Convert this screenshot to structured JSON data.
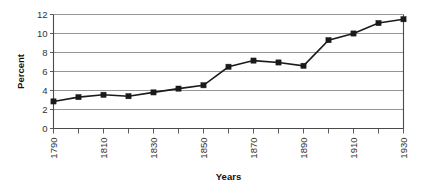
{
  "chart_data": {
    "type": "line",
    "title": "",
    "xlabel": "Years",
    "ylabel": "Percent",
    "x": [
      1790,
      1800,
      1810,
      1820,
      1830,
      1840,
      1850,
      1860,
      1870,
      1880,
      1890,
      1900,
      1910,
      1920,
      1930
    ],
    "values": [
      2.85,
      3.3,
      3.55,
      3.4,
      3.8,
      4.2,
      4.55,
      6.5,
      7.15,
      6.95,
      6.6,
      9.3,
      10.0,
      11.1,
      11.5
    ],
    "series": [
      {
        "name": "Percent",
        "values": [
          2.85,
          3.3,
          3.55,
          3.4,
          3.8,
          4.2,
          4.55,
          6.5,
          7.15,
          6.95,
          6.6,
          9.3,
          10.0,
          11.1,
          11.5
        ]
      }
    ],
    "xlim": [
      1790,
      1930
    ],
    "ylim": [
      0,
      12
    ],
    "ytick_labels": [
      "0",
      "2",
      "4",
      "6",
      "8",
      "10",
      "12"
    ],
    "ytick_values": [
      0,
      2,
      4,
      6,
      8,
      10,
      12
    ],
    "xtick_labels": [
      "1790",
      "1810",
      "1830",
      "1850",
      "1870",
      "1890",
      "1910",
      "1930"
    ],
    "xtick_values": [
      1790,
      1810,
      1830,
      1850,
      1870,
      1890,
      1910,
      1930
    ],
    "xtick_rotation": -90,
    "grid": "horizontal",
    "legend": "none",
    "marker": "square",
    "line_color": "#1a1a1a",
    "marker_color": "#1a1a1a",
    "grid_color": "#7a7a7a",
    "background_color": "#ffffff"
  }
}
